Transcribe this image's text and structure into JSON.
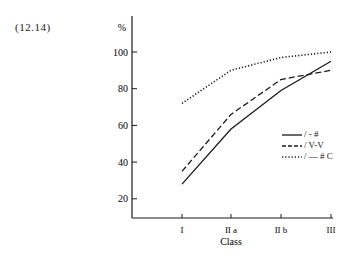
{
  "figure_label": "(12.14)",
  "chart_data": {
    "type": "line",
    "title": "",
    "xlabel": "Class",
    "ylabel": "%",
    "categories": [
      "I",
      "IIa",
      "IIb",
      "III"
    ],
    "category_labels": [
      "I",
      "II a",
      "II b",
      "III"
    ],
    "yticks": [
      20,
      40,
      60,
      80,
      100
    ],
    "ylim": [
      10,
      110
    ],
    "grid": false,
    "legend_position": "right-middle",
    "series": [
      {
        "name": "/ - #",
        "style": "solid",
        "values": [
          28,
          58,
          79,
          95
        ]
      },
      {
        "name": "/ V-V",
        "style": "dashed",
        "values": [
          35,
          66,
          85,
          90
        ]
      },
      {
        "name": "/ — # C",
        "style": "dotted",
        "values": [
          72,
          90,
          97,
          100
        ]
      }
    ]
  },
  "colors": {
    "ink": "#1a1a1a",
    "background": "#ffffff"
  }
}
